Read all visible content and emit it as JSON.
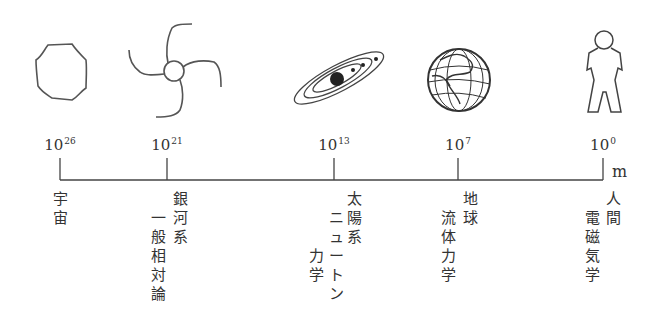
{
  "axis": {
    "unit": "m",
    "ticks": [
      {
        "base": "10",
        "exp": "26",
        "x": 60
      },
      {
        "base": "10",
        "exp": "21",
        "x": 167
      },
      {
        "base": "10",
        "exp": "13",
        "x": 334
      },
      {
        "base": "10",
        "exp": "7",
        "x": 458
      },
      {
        "base": "10",
        "exp": "0",
        "x": 603
      }
    ]
  },
  "labels": [
    {
      "id": "universe",
      "scale": "宇宙",
      "theory": ""
    },
    {
      "id": "galaxy",
      "scale": "銀河系",
      "theory": "一般相対論"
    },
    {
      "id": "solar-system",
      "scale": "太陽系",
      "theory": "ニュートン力学"
    },
    {
      "id": "earth",
      "scale": "地球",
      "theory": "流体力学"
    },
    {
      "id": "human",
      "scale": "人間",
      "theory": "電磁気学"
    }
  ],
  "icons": [
    "universe-blob-icon",
    "galaxy-spiral-icon",
    "solar-system-icon",
    "earth-globe-icon",
    "human-figure-icon"
  ],
  "colors": {
    "line": "#444444",
    "text": "#333333"
  }
}
